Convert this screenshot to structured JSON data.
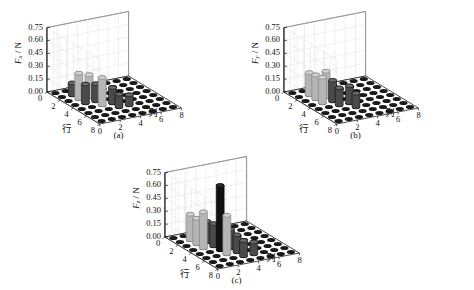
{
  "figure": {
    "panels": [
      {
        "id": "a",
        "caption": "(a)",
        "ylabel_symbol": "F",
        "ylabel_sub": "x",
        "ylabel_unit": " / N",
        "xaxis_name": "行",
        "zaxis_name": "列"
      },
      {
        "id": "b",
        "caption": "(b)",
        "ylabel_symbol": "F",
        "ylabel_sub": "y",
        "ylabel_unit": " / N",
        "xaxis_name": "行",
        "zaxis_name": "列"
      },
      {
        "id": "c",
        "caption": "(c)",
        "ylabel_symbol": "F",
        "ylabel_sub": "z",
        "ylabel_unit": " / N",
        "xaxis_name": "行",
        "zaxis_name": "列"
      }
    ]
  },
  "chart_data": [
    {
      "type": "bar",
      "id": "a",
      "title": "(a)",
      "xlabel": "行",
      "ylabel": "列",
      "zlabel": "F_x / N",
      "zlim": [
        0.0,
        0.75
      ],
      "zticks": [
        "0.00",
        "0.15",
        "0.30",
        "0.45",
        "0.60",
        "0.75"
      ],
      "xticks": [
        "0",
        "2",
        "4",
        "6",
        "8"
      ],
      "yticks": [
        "0",
        "2",
        "4",
        "6",
        "8"
      ],
      "grid": true,
      "rows": [
        1,
        2,
        3,
        4,
        5,
        6,
        7,
        8
      ],
      "cols": [
        1,
        2,
        3,
        4,
        5,
        6,
        7,
        8
      ],
      "bars": [
        {
          "row": 2,
          "col": 2,
          "value": 0.14,
          "shade": "dark"
        },
        {
          "row": 3,
          "col": 2,
          "value": 0.3,
          "shade": "light"
        },
        {
          "row": 3,
          "col": 3,
          "value": 0.26,
          "shade": "light"
        },
        {
          "row": 4,
          "col": 2,
          "value": 0.22,
          "shade": "dark"
        },
        {
          "row": 4,
          "col": 3,
          "value": 0.2,
          "shade": "dark"
        },
        {
          "row": 5,
          "col": 3,
          "value": 0.32,
          "shade": "light"
        },
        {
          "row": 5,
          "col": 4,
          "value": 0.18,
          "shade": "dark"
        },
        {
          "row": 6,
          "col": 4,
          "value": 0.15,
          "shade": "dark"
        },
        {
          "row": 6,
          "col": 5,
          "value": 0.12,
          "shade": "dark"
        }
      ]
    },
    {
      "type": "bar",
      "id": "b",
      "title": "(b)",
      "xlabel": "行",
      "ylabel": "列",
      "zlabel": "F_y / N",
      "zlim": [
        0.0,
        0.75
      ],
      "zticks": [
        "0.00",
        "0.15",
        "0.30",
        "0.45",
        "0.60",
        "0.75"
      ],
      "xticks": [
        "0",
        "2",
        "4",
        "6",
        "8"
      ],
      "yticks": [
        "0",
        "2",
        "4",
        "6",
        "8"
      ],
      "grid": true,
      "rows": [
        1,
        2,
        3,
        4,
        5,
        6,
        7,
        8
      ],
      "cols": [
        1,
        2,
        3,
        4,
        5,
        6,
        7,
        8
      ],
      "bars": [
        {
          "row": 2,
          "col": 2,
          "value": 0.26,
          "shade": "light"
        },
        {
          "row": 3,
          "col": 2,
          "value": 0.28,
          "shade": "light"
        },
        {
          "row": 3,
          "col": 3,
          "value": 0.3,
          "shade": "light"
        },
        {
          "row": 4,
          "col": 2,
          "value": 0.3,
          "shade": "light"
        },
        {
          "row": 4,
          "col": 3,
          "value": 0.24,
          "shade": "dark"
        },
        {
          "row": 5,
          "col": 3,
          "value": 0.2,
          "shade": "dark"
        },
        {
          "row": 5,
          "col": 4,
          "value": 0.2,
          "shade": "dark"
        },
        {
          "row": 6,
          "col": 4,
          "value": 0.16,
          "shade": "dark"
        }
      ]
    },
    {
      "type": "bar",
      "id": "c",
      "title": "(c)",
      "xlabel": "行",
      "ylabel": "列",
      "zlabel": "F_z / N",
      "zlim": [
        0.0,
        0.75
      ],
      "zticks": [
        "0.00",
        "0.15",
        "0.30",
        "0.45",
        "0.60",
        "0.75"
      ],
      "xticks": [
        "0",
        "2",
        "4",
        "6",
        "8"
      ],
      "yticks": [
        "0",
        "2",
        "4",
        "6",
        "8"
      ],
      "grid": true,
      "rows": [
        1,
        2,
        3,
        4,
        5,
        6,
        7,
        8
      ],
      "cols": [
        1,
        2,
        3,
        4,
        5,
        6,
        7,
        8
      ],
      "bars": [
        {
          "row": 2,
          "col": 2,
          "value": 0.3,
          "shade": "light"
        },
        {
          "row": 3,
          "col": 2,
          "value": 0.3,
          "shade": "light"
        },
        {
          "row": 3,
          "col": 3,
          "value": 0.24,
          "shade": "dark"
        },
        {
          "row": 4,
          "col": 2,
          "value": 0.42,
          "shade": "light"
        },
        {
          "row": 4,
          "col": 3,
          "value": 0.26,
          "shade": "dark"
        },
        {
          "row": 5,
          "col": 3,
          "value": 0.75,
          "shade": "black"
        },
        {
          "row": 5,
          "col": 4,
          "value": 0.22,
          "shade": "dark"
        },
        {
          "row": 6,
          "col": 3,
          "value": 0.45,
          "shade": "light"
        },
        {
          "row": 6,
          "col": 4,
          "value": 0.2,
          "shade": "dark"
        },
        {
          "row": 7,
          "col": 4,
          "value": 0.18,
          "shade": "dark"
        },
        {
          "row": 7,
          "col": 5,
          "value": 0.14,
          "shade": "dark"
        }
      ]
    }
  ],
  "colors": {
    "axis": "#000000",
    "grid": "#d8d8d8",
    "marker": "#1a1a1a",
    "bar_light": "#b5b5b5",
    "bar_dark": "#4a4a4a",
    "bar_black": "#111111",
    "background": "#ffffff"
  }
}
